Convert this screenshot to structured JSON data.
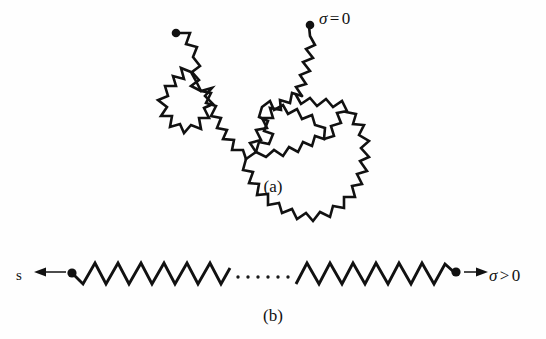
{
  "figure": {
    "background_color": "#fefefe",
    "ink_color": "#111111",
    "panels": [
      {
        "id": "a",
        "caption": "(a)",
        "state_label": {
          "symbol": "σ",
          "relation": "=",
          "value": "0"
        },
        "description": "random coil polymer conformation"
      },
      {
        "id": "b",
        "caption": "(b)",
        "state_label": {
          "symbol": "σ",
          "relation": ">",
          "value": "0"
        },
        "force_label": "s",
        "description": "extended stretched polymer chain under tension"
      }
    ]
  },
  "labels": {
    "sigma_zero": {
      "symbol": "σ",
      "relation": "=",
      "value": "0"
    },
    "sigma_positive": {
      "symbol": "σ",
      "relation": ">",
      "value": "0"
    },
    "tension_left": "s",
    "caption_a": "(a)",
    "caption_b": "(b)",
    "ellipsis_dot_count": 6
  },
  "geometry": {
    "coil": {
      "start_dot": {
        "cx": 176,
        "cy": 33,
        "r": 4.2
      },
      "end_dot": {
        "cx": 310,
        "cy": 25,
        "r": 4.2
      },
      "path": "M176,33 L188,32 L196,42 L190,49 L199,56 L193,65 L201,72 L192,74 L182,68 L173,74 L176,85 L166,88 L163,99 L172,105 L170,116 L181,119 L186,129 L196,124 L203,130 L210,121 L204,112 L212,106 L205,98 L212,91 L204,84 L213,79 L206,71 L216,68 L211,59 L201,62 L192,74 L203,77 L211,85 L207,94 L216,98 L212,108 L222,111 L219,121 L228,124 L224,133 L234,135 L241,143 L251,140 L258,147 L264,138 L259,129 L268,126 L263,117 L272,115 L267,106 L277,104 L272,95 L281,92 L275,84 L284,80 L278,71 L288,68 L282,59 L291,55 L286,46 L296,42 L292,33 L302,30 L310,25",
      "coil_cluster": "M251,140 L262,148 L256,158 L266,162 L262,172 L273,174 L271,185 L282,186 L282,197 L293,196 L295,206 L306,203 L310,213 L320,208 L325,216 L334,209 L337,198 L347,199 L345,188 L355,186 L351,176 L361,173 L356,163 L365,159 L359,150 L368,145 L361,137 L370,132 L362,124 L371,119 L363,111 L352,115 L345,107 L337,113 L330,105 L321,110 L315,101 L306,106 L300,97 L291,102 L285,93 L276,98 L272,88 L262,92 L259,103 L249,101 L246,111 L236,110 L239,120 L229,122 L233,132 L243,134 L251,140"
    },
    "extended_chain": {
      "left_dot": {
        "cx": 71,
        "cy": 273,
        "r": 4.5
      },
      "right_dot": {
        "cx": 455,
        "cy": 273,
        "r": 4.5
      },
      "left_segment_x": [
        71,
        230
      ],
      "right_segment_x": [
        292,
        455
      ],
      "baseline_y": 273,
      "amplitude": 10,
      "period": 23,
      "ellipsis_x_range": [
        236,
        286
      ],
      "ellipsis_y": 277,
      "left_arrow": {
        "x1": 65,
        "y1": 272,
        "x2": 36,
        "y2": 272,
        "direction": "left"
      },
      "right_arrow": {
        "x1": 463,
        "y1": 272,
        "x2": 488,
        "y2": 272,
        "direction": "right"
      }
    }
  }
}
